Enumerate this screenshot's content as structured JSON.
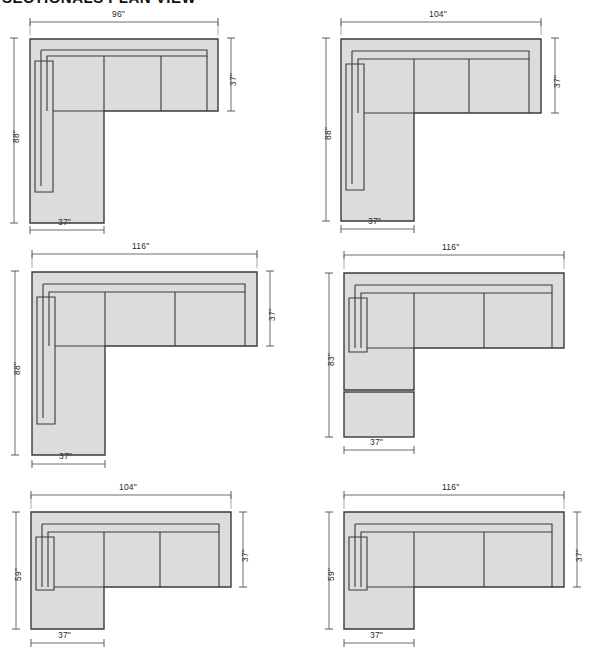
{
  "sheet": {
    "title": "SECTIONALS PLAN VIEW",
    "units": "inches",
    "fill_color": "#dcdcdc",
    "line_color": "#3a3a3a",
    "background": "#ffffff"
  },
  "drawings": [
    {
      "id": "plan-1",
      "name": "sectional-96-88",
      "position": "top-left",
      "overall_width": "96\"",
      "overall_depth": "88\"",
      "sofa_depth": "37\"",
      "chaise_width": "37\"",
      "shape": "L-shape left chaise",
      "has_ottoman": false
    },
    {
      "id": "plan-2",
      "name": "sectional-104-88",
      "position": "top-right",
      "overall_width": "104\"",
      "overall_depth": "88\"",
      "sofa_depth": "37\"",
      "chaise_width": "37\"",
      "shape": "L-shape left chaise",
      "has_ottoman": false
    },
    {
      "id": "plan-3",
      "name": "sectional-116-88",
      "position": "middle-left",
      "overall_width": "116\"",
      "overall_depth": "88\"",
      "sofa_depth": "37\"",
      "chaise_width": "37\"",
      "shape": "L-shape left chaise",
      "has_ottoman": false
    },
    {
      "id": "plan-4",
      "name": "sectional-116-83-ottoman",
      "position": "middle-right",
      "overall_width": "116\"",
      "overall_depth": "83\"",
      "sofa_depth": "37\"",
      "chaise_width": "37\"",
      "shape": "L-shape left chaise with separate ottoman",
      "has_ottoman": true
    },
    {
      "id": "plan-5",
      "name": "sectional-104-59",
      "position": "bottom-left",
      "overall_width": "104\"",
      "overall_depth": "59\"",
      "sofa_depth": "37\"",
      "chaise_width": "37\"",
      "shape": "L-shape left chaise",
      "has_ottoman": false
    },
    {
      "id": "plan-6",
      "name": "sectional-116-59",
      "position": "bottom-right",
      "overall_width": "116\"",
      "overall_depth": "59\"",
      "sofa_depth": "37\"",
      "chaise_width": "37\"",
      "shape": "L-shape left chaise",
      "has_ottoman": false
    }
  ]
}
